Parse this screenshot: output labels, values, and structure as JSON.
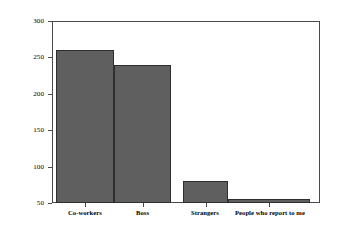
{
  "chart_data": {
    "type": "bar",
    "title": "",
    "xlabel": "",
    "ylabel": "Number of Responses",
    "categories": [
      "Co-workers",
      "Boss",
      "Strangers",
      "People who report to me"
    ],
    "values": [
      260,
      240,
      80,
      56
    ],
    "ylim": [
      50,
      300
    ],
    "yticks": [
      50,
      100,
      150,
      200,
      250,
      300
    ],
    "ytick_labels": [
      "50",
      "100",
      "150",
      "200",
      "250",
      "300"
    ],
    "grid": false,
    "legend": false,
    "bar_color": "#5f5f5f",
    "bar_border_color": "#2e2e2e",
    "frame_color": "#4a4a4a",
    "background_color": "#ffffff"
  }
}
